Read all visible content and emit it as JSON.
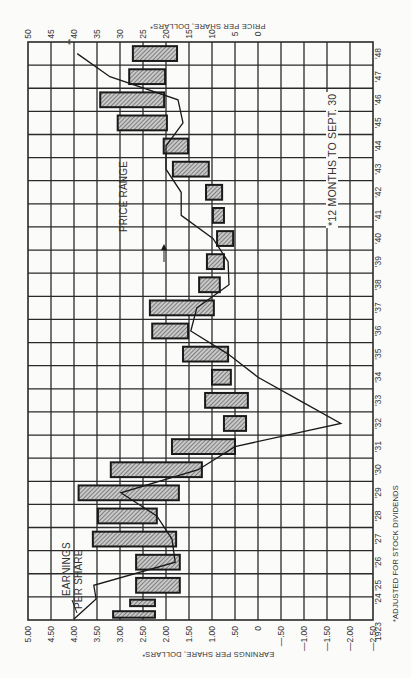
{
  "chart_data": {
    "type": "bar",
    "orientation": "rotated 90 degrees clockwise (years run top-to-bottom on right edge)",
    "title": "",
    "price_axis_label": "Price Per Share, Dollars*",
    "earnings_axis_label": "Earnings Per Share, Dollars*",
    "price_ticks": [
      "50",
      "45",
      "40",
      "35",
      "30",
      "25",
      "20",
      "15",
      "10",
      "5",
      "0"
    ],
    "earnings_ticks": [
      "5.00",
      "4.50",
      "4.00",
      "3.50",
      "3.00",
      "2.50",
      "2.00",
      "1.50",
      "1.00",
      ".50",
      "0",
      "—.50",
      "—1.00",
      "—1.50",
      "—2.00",
      "—2.50"
    ],
    "price_range": [
      0,
      50
    ],
    "earnings_range": [
      -2.5,
      5.0
    ],
    "grid": true,
    "categories": [
      "1923",
      "'24",
      "'25",
      "'26",
      "'27",
      "'28",
      "'29",
      "'30",
      "'31",
      "'32",
      "'33",
      "'34",
      "'35",
      "'36",
      "'37",
      "'38",
      "'39",
      "'40",
      "'41",
      "'42",
      "'43",
      "'44",
      "'45",
      "'46",
      "'47",
      "'48"
    ],
    "series": [
      {
        "name": "Price Range",
        "type": "range-bar",
        "high": [
          31.5,
          27.8,
          26.5,
          26.5,
          35.9,
          34.8,
          39.0,
          32.0,
          18.7,
          7.4,
          11.5,
          10.0,
          16.3,
          23.0,
          23.5,
          12.8,
          11.1,
          8.9,
          9.8,
          11.3,
          18.5,
          20.5,
          30.5,
          34.3,
          28.0,
          27.2
        ],
        "low": [
          22.4,
          22.4,
          17.0,
          17.0,
          17.8,
          22.0,
          17.2,
          12.2,
          5.0,
          2.6,
          2.2,
          5.9,
          6.5,
          15.2,
          9.6,
          8.3,
          7.4,
          5.4,
          7.4,
          7.8,
          10.7,
          15.2,
          19.8,
          20.4,
          20.2,
          17.6
        ]
      },
      {
        "name": "Earnings Per Share",
        "type": "line",
        "values": [
          4.0,
          3.52,
          3.57,
          1.8,
          1.87,
          2.2,
          2.98,
          1.3,
          0.5,
          -1.8,
          -0.9,
          0.0,
          0.65,
          1.46,
          1.33,
          0.63,
          0.65,
          0.98,
          1.67,
          1.67,
          2.0,
          2.0,
          1.63,
          1.74,
          3.22,
          3.93
        ]
      }
    ],
    "annotations": [
      {
        "text": "Price Range",
        "arrow": true
      },
      {
        "text": "Earnings Per Share",
        "arrow": true
      },
      {
        "text": "*12 Months to Sept. 30"
      },
      {
        "text": "**",
        "at": "'48"
      }
    ],
    "footnote": "*Adjusted for Stock Dividends"
  },
  "labels": {
    "price_axis": "PRICE PER SHARE, DOLLARS*",
    "earnings_axis": "EARNINGS PER SHARE, DOLLARS*",
    "price_range": "PRICE RANGE",
    "earnings_1": "EARNINGS",
    "earnings_2": "PER SHARE",
    "note": "*12 MONTHS TO SEPT. 30",
    "footnote": "*ADJUSTED FOR STOCK DIVIDENDS",
    "stars": "**"
  },
  "colors": {
    "grid": "#2a2a2a",
    "bar_fill": "#9a9a9a",
    "bar_border": "#1a1a1a",
    "line": "#1a1a1a",
    "background": "#fbfbfa"
  }
}
